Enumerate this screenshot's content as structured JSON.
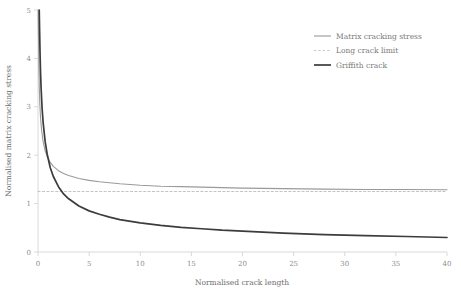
{
  "chart_data": {
    "type": "line",
    "title": "",
    "xlabel": "Normalised crack length",
    "ylabel": "Normalised matrix cracking stress",
    "xlim": [
      0,
      40
    ],
    "ylim": [
      0,
      5
    ],
    "xticks": [
      0,
      5,
      10,
      15,
      20,
      25,
      30,
      35,
      40
    ],
    "xtick_labels": [
      "0",
      "5",
      "10",
      "15",
      "20",
      "25",
      "30",
      "35",
      "40"
    ],
    "yticks": [
      0,
      1,
      2,
      3,
      4,
      5
    ],
    "ytick_labels": [
      "0",
      "1",
      "2",
      "3",
      "4",
      "5"
    ],
    "grid": false,
    "legend_position": "top-right",
    "series": [
      {
        "name": "Matrix cracking stress",
        "style": "solid",
        "color": "#9a9a9a",
        "width": 1.1,
        "x": [
          0.02,
          0.05,
          0.08,
          0.12,
          0.18,
          0.25,
          0.35,
          0.5,
          0.7,
          0.9,
          1.2,
          1.5,
          2.0,
          2.5,
          3.0,
          4.0,
          5.0,
          6.0,
          7.0,
          8.0,
          10.0,
          12.0,
          14.0,
          16.0,
          18.0,
          20.0,
          24.0,
          28.0,
          32.0,
          36.0,
          40.0
        ],
        "y": [
          5.0,
          4.4,
          3.9,
          3.45,
          3.05,
          2.77,
          2.52,
          2.28,
          2.09,
          1.97,
          1.85,
          1.77,
          1.68,
          1.62,
          1.58,
          1.52,
          1.48,
          1.45,
          1.43,
          1.41,
          1.38,
          1.36,
          1.35,
          1.34,
          1.33,
          1.32,
          1.31,
          1.3,
          1.29,
          1.29,
          1.285
        ]
      },
      {
        "name": "Long crack limit",
        "style": "dashed",
        "color": "#c4c4c4",
        "width": 1.0,
        "value": 1.25,
        "x": [
          0,
          40
        ],
        "y": [
          1.25,
          1.25
        ]
      },
      {
        "name": "Griffith crack",
        "style": "solid",
        "color": "#3c3c3c",
        "width": 1.7,
        "x": [
          0.12,
          0.15,
          0.2,
          0.25,
          0.3,
          0.4,
          0.5,
          0.7,
          0.9,
          1.2,
          1.5,
          2.0,
          2.5,
          3.0,
          4.0,
          5.0,
          6.0,
          7.0,
          8.0,
          10.0,
          12.0,
          14.0,
          16.0,
          18.0,
          20.0,
          24.0,
          28.0,
          32.0,
          36.0,
          40.0
        ],
        "y": [
          5.0,
          4.65,
          4.1,
          3.7,
          3.4,
          2.97,
          2.68,
          2.28,
          2.02,
          1.74,
          1.56,
          1.35,
          1.2,
          1.1,
          0.95,
          0.85,
          0.78,
          0.72,
          0.67,
          0.6,
          0.55,
          0.51,
          0.48,
          0.45,
          0.43,
          0.39,
          0.36,
          0.34,
          0.32,
          0.3
        ]
      }
    ]
  },
  "axes": {
    "axis_color": "#d9d9d9",
    "x_title": "Normalised crack length",
    "y_title": "Normalised matrix cracking stress"
  },
  "legend": {
    "items": [
      {
        "label": "Matrix cracking stress",
        "swatch": "solid-gray-line"
      },
      {
        "label": "Long crack limit",
        "swatch": "dashed-lightgray-line"
      },
      {
        "label": "Griffith crack",
        "swatch": "solid-dark-line"
      }
    ]
  }
}
